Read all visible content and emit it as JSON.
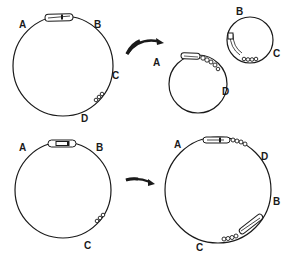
{
  "diagram": {
    "panels": [
      {
        "id": "top",
        "source_plasmid": {
          "labels": [
            "A",
            "B",
            "C",
            "D"
          ]
        },
        "arrow": "curved-right",
        "products": [
          {
            "labels": [
              "A",
              "D"
            ]
          },
          {
            "labels": [
              "B",
              "C"
            ]
          }
        ]
      },
      {
        "id": "bottom",
        "source_plasmid": {
          "labels": [
            "A",
            "B",
            "C"
          ]
        },
        "arrow": "curved-right",
        "products": [
          {
            "labels": [
              "A",
              "D",
              "B",
              "C"
            ]
          }
        ]
      }
    ],
    "labels": {
      "tl_A": "A",
      "tl_B": "B",
      "tl_C": "C",
      "tl_D": "D",
      "tm_A": "A",
      "tm_D": "D",
      "tr_B": "B",
      "tr_C": "C",
      "bl_A": "A",
      "bl_B": "B",
      "bl_C": "C",
      "br_A": "A",
      "br_D": "D",
      "br_B": "B",
      "br_C": "C"
    },
    "colors": {
      "ink": "#1a1a1a",
      "background": "#ffffff"
    }
  }
}
